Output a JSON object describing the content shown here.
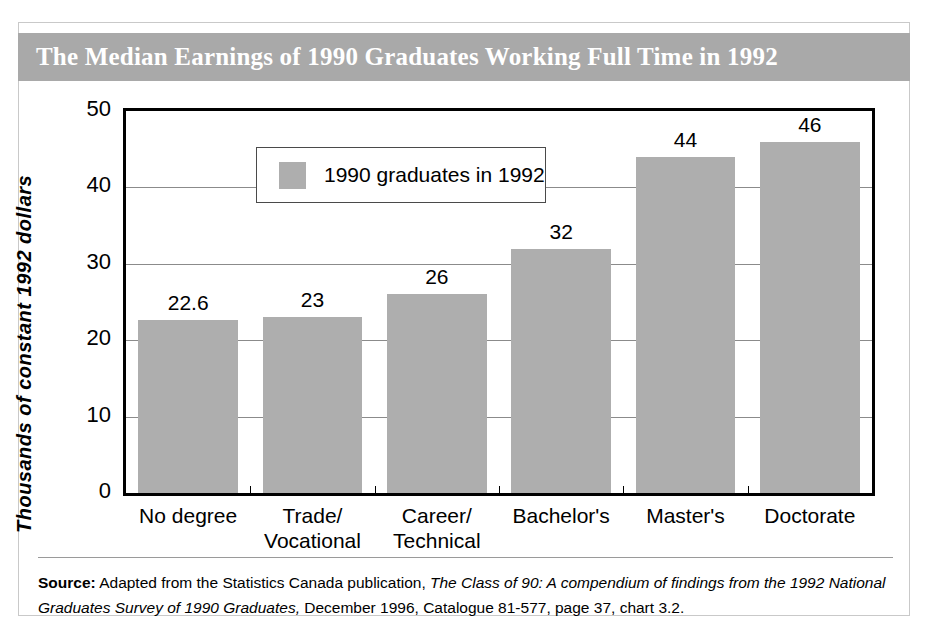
{
  "title": "The Median Earnings of 1990 Graduates Working Full Time in 1992",
  "legend": {
    "label": "1990 graduates in 1992",
    "swatch_color": "#aeaeae"
  },
  "axes": {
    "ylabel": "Thousands of constant 1992 dollars",
    "yticks": [
      "0",
      "10",
      "20",
      "30",
      "40",
      "50"
    ]
  },
  "bars": [
    {
      "category_line1": "No degree",
      "category_line2": "",
      "value": 22.6,
      "label": "22.6"
    },
    {
      "category_line1": "Trade/",
      "category_line2": "Vocational",
      "value": 23,
      "label": "23"
    },
    {
      "category_line1": "Career/",
      "category_line2": "Technical",
      "value": 26,
      "label": "26"
    },
    {
      "category_line1": "Bachelor's",
      "category_line2": "",
      "value": 32,
      "label": "32"
    },
    {
      "category_line1": "Master's",
      "category_line2": "",
      "value": 44,
      "label": "44"
    },
    {
      "category_line1": "Doctorate",
      "category_line2": "",
      "value": 46,
      "label": "46"
    }
  ],
  "source": {
    "prefix": "Source:",
    "line1_plain_a": " Adapted from the Statistics Canada publication, ",
    "line1_italic": "The Class of 90: A compendium of findings from the",
    "line2_italic": "1992 National Graduates Survey of 1990 Graduates,",
    "line2_plain": " December 1996, Catalogue 81-577, page 37, chart 3.2."
  },
  "colors": {
    "banner": "#a9a9a9",
    "bar": "#aeaeae",
    "gridline": "#8b8b8b",
    "frame": "#c9c9c9"
  },
  "chart_data": {
    "type": "bar",
    "title": "The Median Earnings of 1990 Graduates Working Full Time in 1992",
    "categories": [
      "No degree",
      "Trade/Vocational",
      "Career/Technical",
      "Bachelor's",
      "Master's",
      "Doctorate"
    ],
    "values": [
      22.6,
      23,
      26,
      32,
      44,
      46
    ],
    "data_labels": [
      "22.6",
      "23",
      "26",
      "32",
      "44",
      "46"
    ],
    "series": [
      {
        "name": "1990 graduates in 1992",
        "values": [
          22.6,
          23,
          26,
          32,
          44,
          46
        ]
      }
    ],
    "xlabel": "",
    "ylabel": "Thousands of constant 1992 dollars",
    "ylim": [
      0,
      50
    ],
    "ytick_values": [
      0,
      10,
      20,
      30,
      40,
      50
    ],
    "grid": "horizontal",
    "legend_position": "top-left-inside",
    "bar_color": "#aeaeae"
  }
}
